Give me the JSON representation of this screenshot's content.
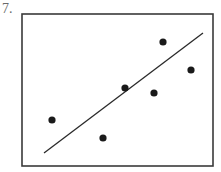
{
  "problem": {
    "number_label": "7."
  },
  "colors": {
    "frame": "#3a3a3a",
    "points": "#1a1a1a",
    "trend_line": "#2a2a2a",
    "label": "#6a6a6a",
    "background": "#ffffff"
  },
  "chart_data": {
    "type": "scatter",
    "title": "",
    "xlabel": "",
    "ylabel": "",
    "grid": false,
    "legend": null,
    "axes_ticks": false,
    "frame_px": {
      "x0": 22,
      "y0": 14,
      "x1": 213,
      "y1": 166
    },
    "points_px": [
      {
        "x": 52,
        "y": 120
      },
      {
        "x": 103,
        "y": 138
      },
      {
        "x": 125,
        "y": 88
      },
      {
        "x": 154,
        "y": 93
      },
      {
        "x": 163,
        "y": 42
      },
      {
        "x": 191,
        "y": 70
      }
    ],
    "points_normalized": [
      {
        "x": 0.16,
        "y": 0.3
      },
      {
        "x": 0.42,
        "y": 0.18
      },
      {
        "x": 0.54,
        "y": 0.51
      },
      {
        "x": 0.69,
        "y": 0.48
      },
      {
        "x": 0.74,
        "y": 0.82
      },
      {
        "x": 0.88,
        "y": 0.63
      }
    ],
    "trend_line_px": {
      "x1": 44,
      "y1": 153,
      "x2": 203,
      "y2": 33
    },
    "trend_line_normalized": {
      "x1": 0.12,
      "y1": 0.09,
      "x2": 0.95,
      "y2": 0.88
    },
    "annotations": []
  }
}
